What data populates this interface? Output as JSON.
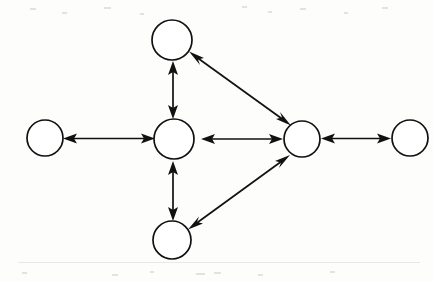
{
  "diagram": {
    "type": "node-link-diagram",
    "background_color": "#fdfdfc",
    "stroke_color": "#111111",
    "node_fill_color": "#ffffff",
    "width": 434,
    "height": 281,
    "arrow_style": "double-headed",
    "nodes": [
      {
        "id": "left",
        "label": "",
        "cx": 45,
        "cy": 138,
        "rx": 18,
        "ry": 18
      },
      {
        "id": "center",
        "label": "",
        "cx": 174,
        "cy": 139,
        "rx": 20,
        "ry": 20
      },
      {
        "id": "top",
        "label": "",
        "cx": 172,
        "cy": 40,
        "rx": 20,
        "ry": 20
      },
      {
        "id": "bottom",
        "label": "",
        "cx": 172,
        "cy": 240,
        "rx": 19,
        "ry": 19
      },
      {
        "id": "right",
        "label": "",
        "cx": 302,
        "cy": 139,
        "rx": 18,
        "ry": 18
      },
      {
        "id": "far-right",
        "label": "",
        "cx": 410,
        "cy": 138,
        "rx": 18,
        "ry": 18
      }
    ],
    "edges": [
      {
        "id": "edge-left-center",
        "from": "left",
        "to": "center",
        "bidirectional": true
      },
      {
        "id": "edge-center-top",
        "from": "center",
        "to": "top",
        "bidirectional": true
      },
      {
        "id": "edge-center-bottom",
        "from": "center",
        "to": "bottom",
        "bidirectional": true
      },
      {
        "id": "edge-center-right",
        "from": "center",
        "to": "right",
        "bidirectional": true
      },
      {
        "id": "edge-right-farright",
        "from": "right",
        "to": "far-right",
        "bidirectional": true
      },
      {
        "id": "edge-top-right",
        "from": "top",
        "to": "right",
        "bidirectional": true
      },
      {
        "id": "edge-bottom-right",
        "from": "bottom",
        "to": "right",
        "bidirectional": true
      }
    ],
    "node_count": 6,
    "edge_count": 7
  }
}
